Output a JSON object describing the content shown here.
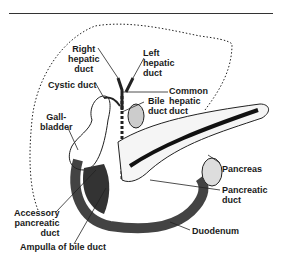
{
  "diagram": {
    "labels": {
      "right_hepatic_duct": [
        "Right",
        "hepatic",
        "duct"
      ],
      "left_hepatic_duct": [
        "Left",
        "hepatic",
        "duct"
      ],
      "cystic_duct": "Cystic duct",
      "common_hepatic_duct": [
        "Common",
        "hepatic",
        "duct"
      ],
      "bile_duct": [
        "Bile",
        "duct"
      ],
      "gallbladder": [
        "Gall-",
        "bladder"
      ],
      "pancreas": "Pancreas",
      "pancreatic_duct": [
        "Pancreatic",
        "duct"
      ],
      "accessory_pancreatic_duct": [
        "Accessory",
        "pancreatic",
        "duct"
      ],
      "duodenum": "Duodenum",
      "ampulla_of_bile_duct": "Ampulla of bile duct"
    },
    "colors": {
      "ink": "#1a1a1a",
      "background": "#ffffff"
    }
  }
}
